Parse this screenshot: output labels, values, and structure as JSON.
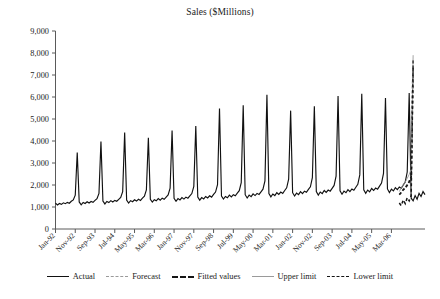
{
  "chart_data": {
    "type": "line",
    "title": "Sales ($Millions)",
    "xlabel": "",
    "ylabel": "",
    "ylim": [
      0,
      9000
    ],
    "ytick_values": [
      0,
      1000,
      2000,
      3000,
      4000,
      5000,
      6000,
      7000,
      8000,
      9000
    ],
    "ytick_labels": [
      "0",
      "1,000",
      "2,000",
      "3,000",
      "4,000",
      "5,000",
      "6,000",
      "7,000",
      "8,000",
      "9,000"
    ],
    "grid": false,
    "legend_position": "bottom",
    "x_start": "Jan-92",
    "x_end": "Aug-06",
    "x_interval_months": 1,
    "xtick_labels": [
      "Jan-92",
      "Nov-92",
      "Sep-93",
      "Jul-94",
      "May-95",
      "Mar-96",
      "Jan-97",
      "Nov-97",
      "Sep-98",
      "Jul-99",
      "May-00",
      "Mar-01",
      "Jan-02",
      "Nov-02",
      "Sep-03",
      "Jul-04",
      "May-05",
      "Mar-06"
    ],
    "xtick_interval_months": 10,
    "annotations": [
      "Annual December sales spikes",
      "Forecast with upper and lower limits at end of series"
    ],
    "series": [
      {
        "name": "Actual",
        "style": "solid",
        "color": "#111111",
        "values": [
          1180,
          1090,
          1160,
          1120,
          1190,
          1150,
          1210,
          1170,
          1260,
          1320,
          1540,
          3480,
          1230,
          1100,
          1210,
          1160,
          1240,
          1180,
          1250,
          1210,
          1300,
          1380,
          1620,
          3980,
          1270,
          1140,
          1250,
          1200,
          1290,
          1230,
          1300,
          1260,
          1350,
          1440,
          1700,
          4380,
          1310,
          1180,
          1290,
          1240,
          1330,
          1270,
          1350,
          1300,
          1400,
          1490,
          1780,
          4150,
          1350,
          1220,
          1330,
          1280,
          1380,
          1310,
          1400,
          1350,
          1450,
          1550,
          1860,
          4480,
          1400,
          1260,
          1380,
          1320,
          1430,
          1360,
          1450,
          1400,
          1510,
          1610,
          1940,
          4680,
          1450,
          1310,
          1430,
          1370,
          1480,
          1410,
          1510,
          1450,
          1570,
          1680,
          2020,
          5480,
          1500,
          1360,
          1480,
          1420,
          1540,
          1460,
          1560,
          1510,
          1630,
          1740,
          2110,
          5620,
          1560,
          1410,
          1540,
          1470,
          1600,
          1520,
          1620,
          1570,
          1690,
          1810,
          2190,
          6100,
          1610,
          1460,
          1590,
          1520,
          1650,
          1570,
          1680,
          1620,
          1750,
          1870,
          2270,
          5380,
          1650,
          1500,
          1630,
          1560,
          1700,
          1610,
          1720,
          1670,
          1800,
          1920,
          2330,
          5580,
          1700,
          1540,
          1680,
          1610,
          1750,
          1660,
          1770,
          1720,
          1850,
          1980,
          2400,
          6050,
          1740,
          1580,
          1720,
          1650,
          1790,
          1700,
          1820,
          1760,
          1900,
          2030,
          2460,
          6150,
          1780,
          1620,
          1770,
          1690,
          1840,
          1750,
          1860,
          1810,
          1950,
          2090,
          2530,
          5950,
          1820,
          1660,
          1810,
          1730,
          1880,
          1790,
          1910,
          1850,
          2000,
          2140,
          2590,
          6180,
          1400,
          1280,
          1520,
          1350,
          1620,
          1480,
          1700,
          1560
        ]
      },
      {
        "name": "Forecast",
        "style": "dashed-light",
        "color": "#9a9a9a",
        "start_index": 174,
        "values": [
          1560,
          1700,
          1820,
          1900,
          2050,
          2200,
          2420,
          7700
        ]
      },
      {
        "name": "Fitted values",
        "style": "dashed-bold",
        "color": "#151515",
        "start_index": 174,
        "values": [
          1560,
          1660,
          1780,
          1860,
          1990,
          2140,
          2360,
          7680
        ]
      },
      {
        "name": "Upper limit",
        "style": "solid-thin",
        "color": "#9a9a9a",
        "start_index": 174,
        "values": [
          1700,
          1880,
          2020,
          2140,
          2300,
          2480,
          2720,
          7900
        ]
      },
      {
        "name": "Lower limit",
        "style": "dashed",
        "color": "#151515",
        "start_index": 174,
        "values": [
          1180,
          1060,
          1320,
          1150,
          1420,
          1280,
          1520,
          7420
        ]
      }
    ]
  },
  "legend": {
    "items": [
      {
        "label": "Actual",
        "swatch": "solid-line-icon"
      },
      {
        "label": "Forecast",
        "swatch": "dashed-light-line-icon"
      },
      {
        "label": "Fitted values",
        "swatch": "dashed-bold-line-icon"
      },
      {
        "label": "Upper limit",
        "swatch": "thin-gray-line-icon"
      },
      {
        "label": "Lower limit",
        "swatch": "dashed-line-icon"
      }
    ]
  }
}
